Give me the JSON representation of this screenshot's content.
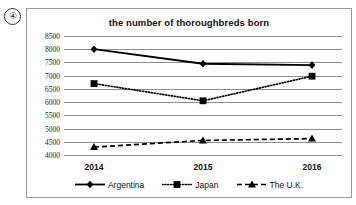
{
  "question_marker": "④",
  "chart_data": {
    "type": "line",
    "title": "the number of thoroughbreds born",
    "xlabel": "",
    "ylabel": "",
    "categories": [
      "2014",
      "2015",
      "2016"
    ],
    "ylim": [
      4000,
      8500
    ],
    "ytick_step": 500,
    "yticks": [
      8500,
      8000,
      7500,
      7000,
      6500,
      6000,
      5500,
      5000,
      4500,
      4000
    ],
    "grid": true,
    "legend_position": "bottom",
    "series": [
      {
        "name": "Argentina",
        "values": [
          8000,
          7450,
          7400
        ],
        "marker": "diamond",
        "linestyle": "solid",
        "color": "#000000"
      },
      {
        "name": "Japan",
        "values": [
          6700,
          6050,
          6980
        ],
        "marker": "square",
        "linestyle": "dotted",
        "color": "#000000"
      },
      {
        "name": "The U.K.",
        "values": [
          4300,
          4550,
          4620
        ],
        "marker": "triangle",
        "linestyle": "dashed",
        "color": "#000000"
      }
    ]
  }
}
